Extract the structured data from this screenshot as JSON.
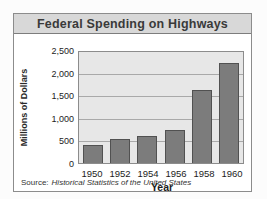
{
  "chart_data": {
    "type": "bar",
    "title": "Federal Spending on Highways",
    "categories": [
      "1950",
      "1952",
      "1954",
      "1956",
      "1958",
      "1960"
    ],
    "values": [
      400,
      530,
      600,
      750,
      1650,
      2250
    ],
    "xlabel": "Year",
    "ylabel": "Millions of Dollars",
    "ylim": [
      0,
      2500
    ],
    "ytick_interval": 500,
    "ytick_labels": [
      "2,500",
      "2,000",
      "1,500",
      "1,000",
      "500",
      "0"
    ],
    "grid": true,
    "legend": "none",
    "bar_color": "#7c7c7c",
    "plot_background": "#e7e7e7",
    "title_bar_background": "#d8d8d8"
  },
  "source": {
    "prefix": "Source:",
    "text": "Historical Statistics of the United States"
  }
}
